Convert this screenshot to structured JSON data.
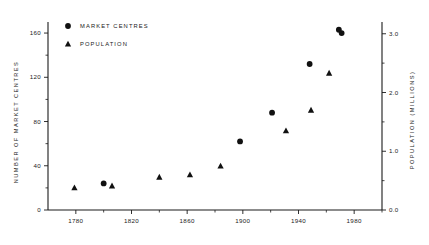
{
  "chart_data": {
    "type": "scatter",
    "title": "",
    "xlabel": "",
    "ylabel": "NUMBER OF MARKET CENTRES",
    "y2label": "POPULATION (MILLIONS)",
    "xlim": [
      1760,
      2000
    ],
    "ylim": [
      0,
      170
    ],
    "y2lim": [
      0.0,
      3.2
    ],
    "grid": false,
    "legend_position": "top-left",
    "x_ticks": [
      1780,
      1820,
      1860,
      1900,
      1940,
      1980
    ],
    "x_tick_labels": [
      "1780",
      "1820",
      "1860",
      "1900",
      "1940",
      "1980"
    ],
    "x_minor_ticks": [
      1800,
      1840,
      1880,
      1920,
      1960,
      2000
    ],
    "y_ticks": [
      0,
      40,
      80,
      120,
      160
    ],
    "y_tick_labels": [
      "0",
      "40",
      "80",
      "120",
      "160"
    ],
    "y_minor_ticks": [
      20,
      60,
      100,
      140
    ],
    "y2_ticks": [
      0.0,
      1.0,
      2.0,
      3.0
    ],
    "y2_tick_labels": [
      "0.0",
      "1.0",
      "2.0",
      "3.0"
    ],
    "y2_minor_ticks": [
      0.5,
      1.5,
      2.5
    ],
    "series": [
      {
        "name": "MARKET CENTRES",
        "marker": "circle",
        "axis": "left",
        "points": [
          {
            "x": 1800,
            "y": 24
          },
          {
            "x": 1898,
            "y": 62
          },
          {
            "x": 1921,
            "y": 88
          },
          {
            "x": 1948,
            "y": 132
          },
          {
            "x": 1969,
            "y": 163
          },
          {
            "x": 1971,
            "y": 160
          }
        ]
      },
      {
        "name": "POPULATION",
        "marker": "triangle",
        "axis": "right",
        "points": [
          {
            "x": 1779,
            "y": 0.38
          },
          {
            "x": 1806,
            "y": 0.41
          },
          {
            "x": 1840,
            "y": 0.56
          },
          {
            "x": 1862,
            "y": 0.6
          },
          {
            "x": 1884,
            "y": 0.75
          },
          {
            "x": 1931,
            "y": 1.35
          },
          {
            "x": 1949,
            "y": 1.7
          },
          {
            "x": 1962,
            "y": 2.33
          }
        ]
      }
    ]
  },
  "legend": {
    "items": [
      {
        "label": "MARKET CENTRES",
        "marker": "circle"
      },
      {
        "label": "POPULATION",
        "marker": "triangle"
      }
    ]
  },
  "axes": {
    "left_title": "NUMBER OF MARKET CENTRES",
    "right_title": "POPULATION (MILLIONS)"
  }
}
